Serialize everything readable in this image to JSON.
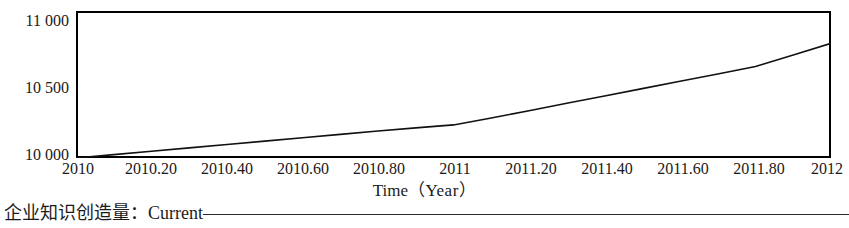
{
  "chart_data": {
    "type": "line",
    "title": "",
    "xlabel": "Time（Year）",
    "ylabel": "",
    "xlim": [
      2010,
      2012
    ],
    "ylim": [
      10000,
      11000
    ],
    "grid": false,
    "legend_position": "below-axis",
    "x_ticks": [
      "2010",
      "2010.20",
      "2010.40",
      "2010.60",
      "2010.80",
      "2011",
      "2011.20",
      "2011.40",
      "2011.60",
      "2011.80",
      "2012"
    ],
    "x_tick_values": [
      2010,
      2010.2,
      2010.4,
      2010.6,
      2010.8,
      2011,
      2011.2,
      2011.4,
      2011.6,
      2011.8,
      2012
    ],
    "y_ticks": [
      "10 000",
      "10 500",
      "11 000"
    ],
    "y_tick_values": [
      10000,
      10500,
      11000
    ],
    "series": [
      {
        "name": "企业知识创造量：Current",
        "color": "#000000",
        "x": [
          2010,
          2010.1,
          2010.2,
          2010.3,
          2010.4,
          2010.5,
          2010.6,
          2010.7,
          2010.8,
          2010.9,
          2011,
          2011.1,
          2011.2,
          2011.3,
          2011.4,
          2011.5,
          2011.6,
          2011.7,
          2011.8,
          2011.9,
          2012
        ],
        "values": [
          10000,
          10023,
          10046,
          10069,
          10092,
          10115,
          10138,
          10161,
          10184,
          10205,
          10225,
          10272,
          10322,
          10372,
          10422,
          10472,
          10522,
          10572,
          10622,
          10700,
          10780
        ]
      }
    ]
  },
  "axis": {
    "x_title_main": "Time",
    "x_title_unit": "（Year）"
  },
  "legend": {
    "variable_label": "企业知识创造量：",
    "run_label": "Current"
  }
}
